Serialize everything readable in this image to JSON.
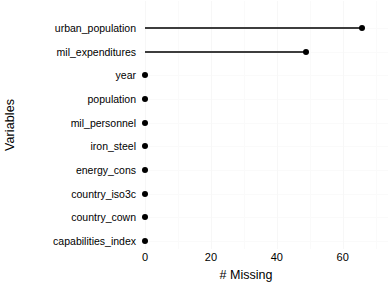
{
  "chart_data": {
    "type": "bar",
    "chart_style": "lollipop-horizontal",
    "title": "",
    "subtitle": "",
    "xlabel": "# Missing",
    "ylabel": "Variables",
    "categories": [
      "urban_population",
      "mil_expenditures",
      "year",
      "population",
      "mil_personnel",
      "iron_steel",
      "energy_cons",
      "country_iso3c",
      "country_cown",
      "capabilities_index"
    ],
    "values": [
      66,
      49,
      0,
      0,
      0,
      0,
      0,
      0,
      0,
      0
    ],
    "xlim": [
      0,
      68
    ],
    "xticks": [
      0,
      20,
      40,
      60
    ],
    "xtick_labels": [
      "0",
      "20",
      "40",
      "60"
    ],
    "grid": true,
    "grid_color": "#fafafa",
    "legend": false,
    "legend_position": "none",
    "point_color": "#000000",
    "line_color": "#3d3d3d",
    "background": "#ffffff",
    "annotations": []
  },
  "axes": {
    "y_title": "Variables",
    "x_title": "# Missing"
  }
}
